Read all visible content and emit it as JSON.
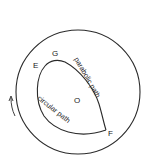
{
  "diagram": {
    "labels": {
      "E": "E",
      "G": "G",
      "F": "F",
      "O": "O"
    },
    "paths": {
      "parabolic": "parabolic path",
      "circular": "circular path"
    },
    "arrow": "rotation-direction-arrow",
    "colors": {
      "stroke": "#2a2a2a",
      "background": "#ffffff"
    }
  }
}
